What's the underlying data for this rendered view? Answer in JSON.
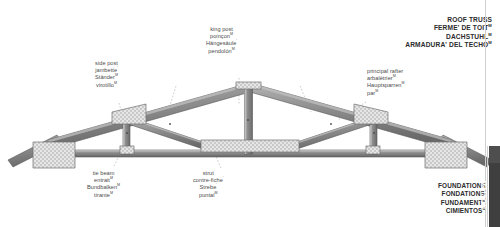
{
  "title_block": {
    "lines": [
      {
        "text": "ROOF TRUSS",
        "marker": ""
      },
      {
        "text": "FERME' DE TOIT",
        "marker": "M"
      },
      {
        "text": "DACHSTUHL",
        "marker": "M"
      },
      {
        "text": "ARMADURA' DEL TECHO",
        "marker": "M"
      }
    ]
  },
  "foundations_block": {
    "lines": [
      {
        "text": "FOUNDATIONS",
        "marker": ""
      },
      {
        "text": "FONDATIONS",
        "marker": "'"
      },
      {
        "text": "FUNDAMENT",
        "marker": "M"
      },
      {
        "text": "CIMIENTOS",
        "marker": "M"
      }
    ]
  },
  "section_tab": {
    "label": "MAISON"
  },
  "callouts": [
    {
      "id": "side-post",
      "lines": [
        {
          "text": "side post",
          "marker": ""
        },
        {
          "text": "jambette",
          "marker": "'"
        },
        {
          "text": "Ständer",
          "marker": "M"
        },
        {
          "text": "virotillo",
          "marker": "M"
        }
      ]
    },
    {
      "id": "king-post",
      "lines": [
        {
          "text": "king post",
          "marker": ""
        },
        {
          "text": "poinçon",
          "marker": "M"
        },
        {
          "text": "Hängesäule",
          "marker": "'"
        },
        {
          "text": "pendolón",
          "marker": "M"
        }
      ]
    },
    {
      "id": "principal-rafter",
      "lines": [
        {
          "text": "principal rafter",
          "marker": ""
        },
        {
          "text": "arbalétrier",
          "marker": "M"
        },
        {
          "text": "Hauptsparren",
          "marker": "M"
        },
        {
          "text": "par",
          "marker": "M"
        }
      ]
    },
    {
      "id": "tie-beam",
      "lines": [
        {
          "text": "tie beam",
          "marker": ""
        },
        {
          "text": "entrait",
          "marker": "M"
        },
        {
          "text": "Bundbalken",
          "marker": "M"
        },
        {
          "text": "tirante",
          "marker": "M"
        }
      ]
    },
    {
      "id": "strut",
      "lines": [
        {
          "text": "strut",
          "marker": ""
        },
        {
          "text": "contre-fiche",
          "marker": "'"
        },
        {
          "text": "Strebe",
          "marker": "'"
        },
        {
          "text": "puntal",
          "marker": "M"
        }
      ]
    }
  ],
  "colors": {
    "beam_face": "#8c8c8c",
    "beam_edge": "#5a5a5a",
    "beam_dark": "#6e6e6e",
    "plate_fill": "#e4e4e4",
    "plate_stroke": "#6f6f6f",
    "plate_dot": "#9a9a9a",
    "leader": "#9b9b9b",
    "text": "#4a4a4a",
    "heading": "#2b2b2b",
    "tab": "#3f3f3f",
    "tab_cap": "#4e4e4e"
  }
}
